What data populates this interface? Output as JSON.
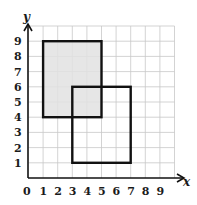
{
  "diagram": {
    "type": "coordinate-grid",
    "x_axis": {
      "label": "x",
      "ticks": [
        "0",
        "1",
        "2",
        "3",
        "4",
        "5",
        "6",
        "7",
        "8",
        "9"
      ]
    },
    "y_axis": {
      "label": "y",
      "ticks": [
        "1",
        "2",
        "3",
        "4",
        "5",
        "6",
        "7",
        "8",
        "9"
      ]
    },
    "grid_range": {
      "x": [
        0,
        10
      ],
      "y": [
        0,
        10
      ]
    },
    "shapes": [
      {
        "name": "shaded-rectangle",
        "x1": 1,
        "y1": 4,
        "x2": 5,
        "y2": 9,
        "fill": "#e2e2e2",
        "stroke": "#111111"
      },
      {
        "name": "outline-rectangle",
        "x1": 3,
        "y1": 1,
        "x2": 7,
        "y2": 6,
        "fill": "none",
        "stroke": "#111111"
      }
    ],
    "colors": {
      "grid": "#c8c8c8",
      "axis": "#111111",
      "shade": "#e2e2e2"
    }
  }
}
